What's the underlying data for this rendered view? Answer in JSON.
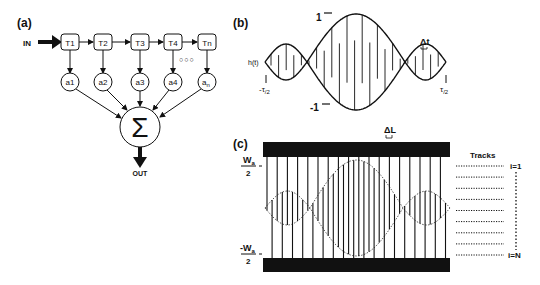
{
  "panel_a": {
    "label": "(a)",
    "input_label": "IN",
    "output_label": "OUT",
    "delay_taps": [
      "T1",
      "T2",
      "T3",
      "T4",
      "Tn"
    ],
    "weights": [
      "a1",
      "a2",
      "a3",
      "a4",
      "an"
    ],
    "weight_last_main": "a",
    "weight_last_sub": "n",
    "ellipsis": "○○○",
    "sum_symbol": "Σ"
  },
  "panel_b": {
    "label": "(b)",
    "function_label": "h(t)",
    "y_max_label": "1",
    "y_min_label": "-1",
    "x_left_label_main": "-τ",
    "x_left_label_sub": "/2",
    "x_right_label_main": "τ",
    "x_right_label_sub": "/2",
    "delta_label": "Δt"
  },
  "panel_c": {
    "label": "(c)",
    "delta_label": "ΔL",
    "top_label_main": "W",
    "top_label_sub": "a",
    "top_label_den": "2",
    "bottom_label_main": "-W",
    "bottom_label_sub": "a",
    "bottom_label_den": "2",
    "tracks_title": "Tracks",
    "track_first": "i=1",
    "track_last": "i=N",
    "track_count": 9
  },
  "colors": {
    "ink": "#111111",
    "background": "#ffffff"
  }
}
